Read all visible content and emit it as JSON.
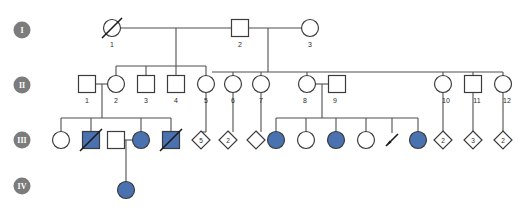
{
  "diagram": {
    "type": "pedigree-chart",
    "width": 521,
    "height": 219,
    "background_color": "#ffffff",
    "line_color": "#4f4f4f",
    "symbol_stroke_color": "#3b3b3b",
    "affected_fill_color": "#4a72b0",
    "unaffected_fill_color": "#ffffff",
    "generation_badge_color": "#7c7c7c"
  },
  "generations": [
    {
      "id": "gen-1",
      "label": "I",
      "badge_cx": 22,
      "badge_cy": 30
    },
    {
      "id": "gen-2",
      "label": "II",
      "badge_cx": 22,
      "badge_cy": 85
    },
    {
      "id": "gen-3",
      "label": "III",
      "badge_cx": 22,
      "badge_cy": 140
    },
    {
      "id": "gen-4",
      "label": "IV",
      "badge_cx": 22,
      "badge_cy": 186
    }
  ],
  "individuals": [
    {
      "key": "I-1",
      "generation": "I",
      "id_label": "1",
      "shape": "circle",
      "affected": false,
      "deceased": true,
      "cx": 112,
      "cy": 28
    },
    {
      "key": "I-2",
      "generation": "I",
      "id_label": "2",
      "shape": "square",
      "affected": false,
      "deceased": false,
      "cx": 240,
      "cy": 28
    },
    {
      "key": "I-3",
      "generation": "I",
      "id_label": "3",
      "shape": "circle",
      "affected": false,
      "deceased": false,
      "cx": 310,
      "cy": 28
    },
    {
      "key": "II-1",
      "generation": "II",
      "id_label": "1",
      "shape": "square",
      "affected": false,
      "deceased": false,
      "cx": 87,
      "cy": 84
    },
    {
      "key": "II-2",
      "generation": "II",
      "id_label": "2",
      "shape": "circle",
      "affected": false,
      "deceased": false,
      "cx": 116,
      "cy": 84
    },
    {
      "key": "II-3",
      "generation": "II",
      "id_label": "3",
      "shape": "square",
      "affected": false,
      "deceased": false,
      "cx": 146,
      "cy": 84
    },
    {
      "key": "II-4",
      "generation": "II",
      "id_label": "4",
      "shape": "square",
      "affected": false,
      "deceased": false,
      "cx": 176,
      "cy": 84
    },
    {
      "key": "II-5",
      "generation": "II",
      "id_label": "5",
      "shape": "circle",
      "affected": false,
      "deceased": false,
      "cx": 206,
      "cy": 84
    },
    {
      "key": "II-6",
      "generation": "II",
      "id_label": "6",
      "shape": "circle",
      "affected": false,
      "deceased": false,
      "cx": 233,
      "cy": 84
    },
    {
      "key": "II-7",
      "generation": "II",
      "id_label": "7",
      "shape": "circle",
      "affected": false,
      "deceased": false,
      "cx": 261,
      "cy": 84
    },
    {
      "key": "II-8",
      "generation": "II",
      "id_label": "8",
      "shape": "circle",
      "affected": false,
      "deceased": false,
      "cx": 307,
      "cy": 84
    },
    {
      "key": "II-9",
      "generation": "II",
      "id_label": "9",
      "shape": "square",
      "affected": false,
      "deceased": false,
      "cx": 337,
      "cy": 84
    },
    {
      "key": "II-10",
      "generation": "II",
      "id_label": "10",
      "shape": "circle",
      "affected": false,
      "deceased": false,
      "cx": 443,
      "cy": 84
    },
    {
      "key": "II-11",
      "generation": "II",
      "id_label": "11",
      "shape": "square",
      "affected": false,
      "deceased": false,
      "cx": 473,
      "cy": 84
    },
    {
      "key": "II-12",
      "generation": "II",
      "id_label": "12",
      "shape": "circle",
      "affected": false,
      "deceased": false,
      "cx": 503,
      "cy": 84
    },
    {
      "key": "III-1",
      "generation": "III",
      "id_label": "",
      "shape": "circle",
      "affected": false,
      "deceased": false,
      "cx": 61,
      "cy": 140
    },
    {
      "key": "III-2",
      "generation": "III",
      "id_label": "",
      "shape": "square",
      "affected": true,
      "deceased": true,
      "cx": 91,
      "cy": 140
    },
    {
      "key": "III-3",
      "generation": "III",
      "id_label": "",
      "shape": "square",
      "affected": false,
      "deceased": false,
      "cx": 116,
      "cy": 140
    },
    {
      "key": "III-4",
      "generation": "III",
      "id_label": "",
      "shape": "circle",
      "affected": true,
      "deceased": false,
      "cx": 141,
      "cy": 140
    },
    {
      "key": "III-5",
      "generation": "III",
      "id_label": "",
      "shape": "square",
      "affected": true,
      "deceased": true,
      "cx": 171,
      "cy": 140
    },
    {
      "key": "III-10",
      "generation": "III",
      "id_label": "",
      "shape": "circle",
      "affected": true,
      "deceased": false,
      "cx": 276,
      "cy": 140
    },
    {
      "key": "III-11",
      "generation": "III",
      "id_label": "",
      "shape": "circle",
      "affected": false,
      "deceased": false,
      "cx": 306,
      "cy": 140
    },
    {
      "key": "III-12",
      "generation": "III",
      "id_label": "",
      "shape": "circle",
      "affected": true,
      "deceased": false,
      "cx": 336,
      "cy": 140
    },
    {
      "key": "III-13",
      "generation": "III",
      "id_label": "",
      "shape": "circle",
      "affected": false,
      "deceased": false,
      "cx": 366,
      "cy": 140
    },
    {
      "key": "III-15",
      "generation": "III",
      "id_label": "",
      "shape": "circle",
      "affected": true,
      "deceased": false,
      "cx": 418,
      "cy": 140
    },
    {
      "key": "IV-1",
      "generation": "IV",
      "id_label": "",
      "shape": "circle",
      "affected": true,
      "deceased": false,
      "cx": 126,
      "cy": 190
    }
  ],
  "sibling_count_diamonds": [
    {
      "key": "III-d1",
      "count_label": "5",
      "cx": 201,
      "cy": 140
    },
    {
      "key": "III-d2",
      "count_label": "2",
      "cx": 226,
      "cy": 140
    },
    {
      "key": "III-d3",
      "count_label": "",
      "cx": 251,
      "cy": 140
    },
    {
      "key": "III-d4",
      "count_label": "2",
      "cx": 443,
      "cy": 140
    },
    {
      "key": "III-d5",
      "count_label": "3",
      "cx": 473,
      "cy": 140
    },
    {
      "key": "III-d6",
      "count_label": "2",
      "cx": 503,
      "cy": 140
    }
  ],
  "pregnancy_loss": [
    {
      "key": "III-14",
      "cx": 392,
      "cy": 140,
      "symbol": "miscarriage-slash"
    }
  ]
}
